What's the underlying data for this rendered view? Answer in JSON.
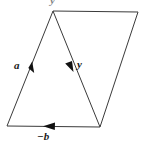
{
  "figure": {
    "background_color": "#ffffff",
    "stroke_color": "#3a3a3a",
    "label_color": "#1a1a1a",
    "width": 143,
    "height": 150,
    "labels": {
      "left_vector": "a",
      "diagonal_vector": "y",
      "bottom_vector": "−b",
      "top_clipped": "y"
    },
    "vertices": {
      "apex": "53,11",
      "top_right": "138,12",
      "bottom_right": "100,127",
      "bottom_left": "7,126"
    },
    "arrows": [
      {
        "name": "a",
        "on": "left-edge",
        "direction": "up-right",
        "at": "31,67"
      },
      {
        "name": "y",
        "on": "diagonal",
        "direction": "down-right",
        "at": "70,66"
      },
      {
        "name": "-b",
        "on": "bottom-edge",
        "direction": "left",
        "at": "50,126"
      }
    ]
  }
}
